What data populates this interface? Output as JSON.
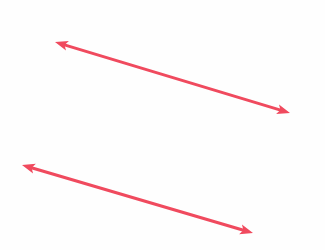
{
  "canvas": {
    "width": 325,
    "height": 250,
    "background_color": "#fefefe",
    "title": "Two parallel double-headed arrows"
  },
  "style": {
    "arrow_color": "#f04a5e",
    "stroke_width": 3,
    "arrowhead_length": 13,
    "arrowhead_width": 10,
    "arrowhead_notch": 3
  },
  "shapes": [
    {
      "name": "upper-arrow",
      "type": "double-headed-arrow",
      "label": "Upper double-headed arrow",
      "start": {
        "x": 55,
        "y": 42
      },
      "end": {
        "x": 290,
        "y": 113
      },
      "direction": "bidirectional",
      "color": "#f04a5e",
      "angle_degrees": 16.8,
      "length": 245.5
    },
    {
      "name": "lower-arrow",
      "type": "double-headed-arrow",
      "label": "Lower double-headed arrow",
      "start": {
        "x": 22,
        "y": 165
      },
      "end": {
        "x": 253,
        "y": 233
      },
      "direction": "bidirectional",
      "color": "#f04a5e",
      "angle_degrees": 16.4,
      "length": 240.8
    }
  ]
}
